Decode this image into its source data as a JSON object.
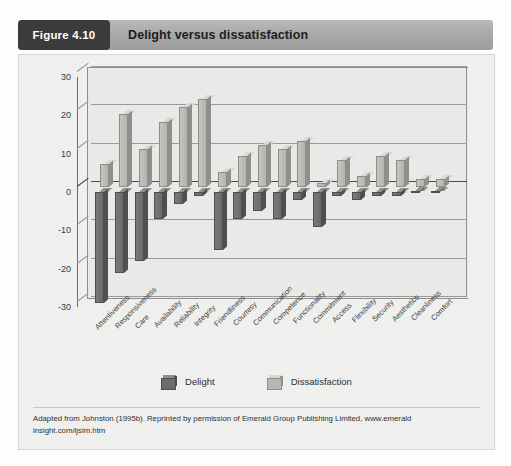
{
  "figure": {
    "badge": "Figure 4.10",
    "title": "Delight versus dissatisfaction",
    "footnote": "Adapted from Johnston (1995b). Reprinted by permission of Emerald Group Publishing Limited, www.emerald insight.com/ijsim.htm"
  },
  "colors": {
    "delight": "#6c6c6a",
    "dissatisfaction": "#b6b6b2",
    "badge_bg": "#3b3b3b",
    "header_bg": "#a9a9a9",
    "plot_bg": "#e9e9e7",
    "card_bg": "#efefee"
  },
  "chart_data": {
    "type": "bar",
    "title": "Delight versus dissatisfaction",
    "xlabel": "",
    "ylabel": "",
    "ylim": [
      -30,
      30
    ],
    "yticks": [
      30,
      20,
      10,
      0,
      -10,
      -20,
      -30
    ],
    "ytick_labels": [
      "30",
      "20",
      "10",
      "0",
      "-10",
      "-20",
      "-30"
    ],
    "grid": true,
    "legend_position": "bottom",
    "orientation": "vertical",
    "style": "3d-clustered-column",
    "categories": [
      "Attentiveness",
      "Responsiveness",
      "Care",
      "Availability",
      "Reliability",
      "Integrity",
      "Friendliness",
      "Courtesy",
      "Communication",
      "Competence",
      "Functionality",
      "Commitment",
      "Access",
      "Flexibility",
      "Security",
      "Aesthetics",
      "Cleanliness",
      "Comfort"
    ],
    "series": [
      {
        "name": "Dissatisfaction",
        "color": "#b6b6b2",
        "values": [
          6,
          19,
          10,
          17,
          21,
          23,
          4,
          8,
          11,
          10,
          12,
          1,
          7,
          3,
          8,
          7,
          2,
          2
        ]
      },
      {
        "name": "Delight",
        "color": "#6c6c6a",
        "values": [
          -29,
          -21,
          -18,
          -7,
          -3,
          -1,
          -15,
          -7,
          -5,
          -7,
          -2,
          -9,
          -1,
          -2,
          -1,
          -1,
          0,
          0
        ]
      }
    ]
  },
  "legend": [
    {
      "label": "Delight",
      "swatch": "dark-cube-icon"
    },
    {
      "label": "Dissatisfaction",
      "swatch": "light-cube-icon"
    }
  ]
}
